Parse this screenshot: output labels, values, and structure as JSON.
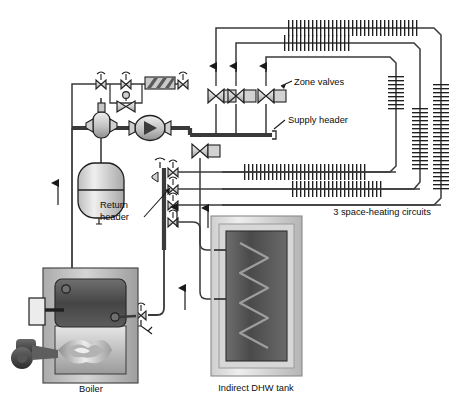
{
  "diagram": {
    "type": "piping-schematic",
    "labels": {
      "zone_valves": "Zone valves",
      "supply_header": "Supply header",
      "return_header_line1": "Return",
      "return_header_line2": "header",
      "space_heating_circuits": "3 space-heating circuits",
      "boiler": "Boiler",
      "indirect_dhw_tank": "Indirect DHW tank"
    },
    "components": {
      "boiler": {
        "name": "Boiler",
        "parts": [
          "jacket",
          "heat-exchanger",
          "burner-flame",
          "blower"
        ]
      },
      "dhw_tank": {
        "name": "Indirect DHW tank",
        "parts": [
          "shell",
          "insulation",
          "heat-exchanger-coil"
        ]
      },
      "expansion_tank": {
        "name": "expansion tank"
      },
      "air_separator": {
        "name": "air separator with air vent"
      },
      "circulator": {
        "name": "circulator pump"
      },
      "makeup_water": {
        "name": "make-up water assembly",
        "parts": [
          "shutoff valve",
          "pressure-reducing valve",
          "backflow preventer",
          "shutoff valve"
        ]
      },
      "zone_valve_count": 3,
      "space_heating_circuit_count": 3,
      "supply_header_valve_count": 1,
      "return_header_valve_count": 4
    },
    "colors": {
      "line": "#1a1a1a",
      "pipe": "#4a4a4a",
      "valve_body": "#d8d8d8",
      "actuator": "#cccccc",
      "tank_light": "#e8e8e8",
      "tank_mid": "#bfbfbf",
      "tank_dark": "#6b6b6b",
      "hx_dark": "#4f4f4f",
      "flame": "#d9d9d9",
      "background": "#ffffff"
    }
  }
}
